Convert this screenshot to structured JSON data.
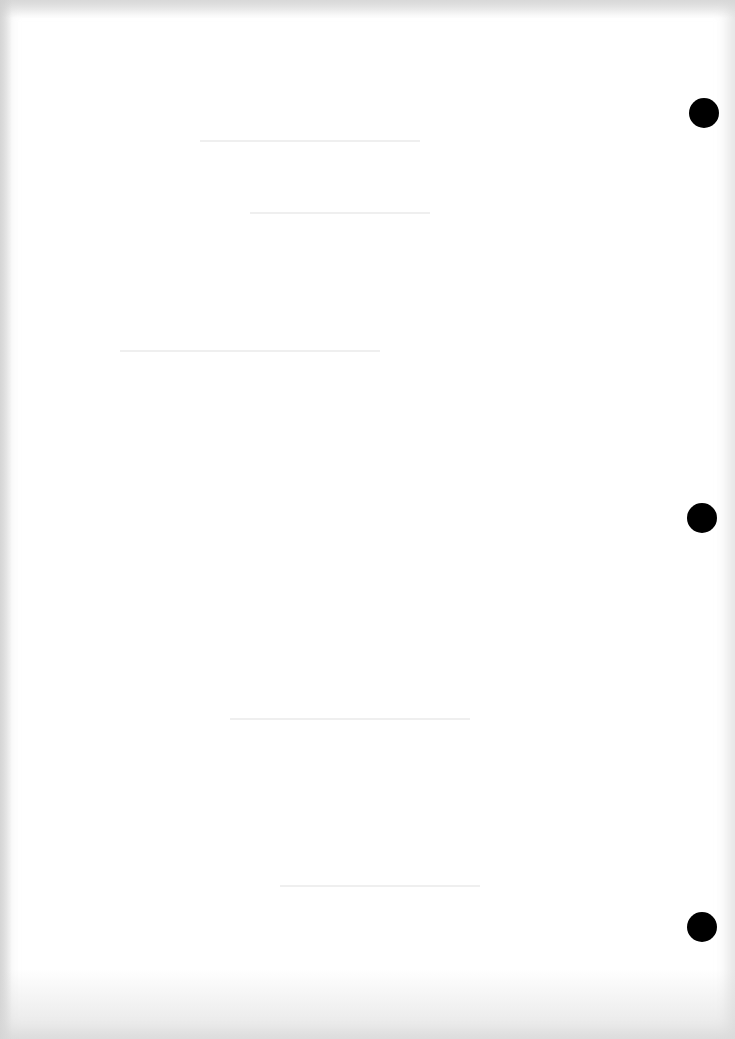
{
  "document": {
    "type": "blank scanned page",
    "text": "",
    "background_color": "#ffffff",
    "punch_holes": [
      {
        "cx": 704,
        "cy": 113
      },
      {
        "cx": 702,
        "cy": 518
      },
      {
        "cx": 702,
        "cy": 927
      }
    ],
    "hole_color": "#000000"
  }
}
